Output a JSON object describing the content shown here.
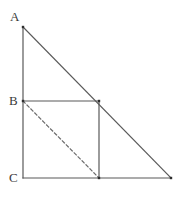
{
  "figure": {
    "name": "right-triangle-with-inscribed-square",
    "background_color": "#ffffff",
    "stroke_color": "#595959",
    "dashed_stroke_color": "#6b6b6b",
    "label_color": "#3a3a3a",
    "stroke_width": 1.2,
    "dash_pattern": "3,2.6",
    "labels": [
      {
        "id": "A",
        "text": "A",
        "x": 10,
        "y": 10
      },
      {
        "id": "B",
        "text": "B",
        "x": 9,
        "y": 94
      },
      {
        "id": "C",
        "text": "C",
        "x": 9,
        "y": 171
      }
    ],
    "points": {
      "A": {
        "x": 23,
        "y": 27
      },
      "B": {
        "x": 23,
        "y": 101
      },
      "C": {
        "x": 23,
        "y": 178
      },
      "right_vertex": {
        "x": 171,
        "y": 178
      },
      "square_top_right": {
        "x": 99,
        "y": 101
      },
      "square_bottom_right": {
        "x": 99,
        "y": 178
      }
    },
    "segments": [
      {
        "id": "leg-AC",
        "style": "solid",
        "x1": 23,
        "y1": 27,
        "x2": 23,
        "y2": 178
      },
      {
        "id": "base-C-to-right",
        "style": "solid",
        "x1": 23,
        "y1": 178,
        "x2": 171,
        "y2": 178
      },
      {
        "id": "hypotenuse-A-to-right",
        "style": "solid",
        "x1": 23,
        "y1": 27,
        "x2": 171,
        "y2": 178
      },
      {
        "id": "square-top-edge",
        "style": "solid",
        "x1": 23,
        "y1": 101,
        "x2": 99,
        "y2": 101
      },
      {
        "id": "square-right-edge",
        "style": "solid",
        "x1": 99,
        "y1": 101,
        "x2": 99,
        "y2": 178
      },
      {
        "id": "square-diagonal",
        "style": "dashed",
        "x1": 23,
        "y1": 101,
        "x2": 99,
        "y2": 178
      }
    ],
    "vertex_dots": [
      {
        "id": "dot-A",
        "x": 23,
        "y": 27
      },
      {
        "id": "dot-B",
        "x": 23,
        "y": 101
      },
      {
        "id": "dot-square-top-right",
        "x": 99,
        "y": 101
      },
      {
        "id": "dot-square-bottom-right",
        "x": 99,
        "y": 178
      },
      {
        "id": "dot-right-vertex",
        "x": 171,
        "y": 178
      }
    ]
  }
}
